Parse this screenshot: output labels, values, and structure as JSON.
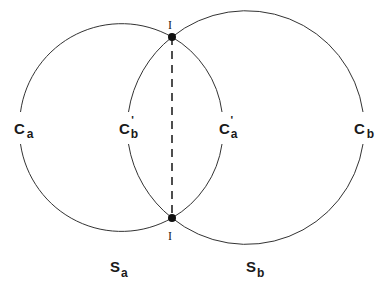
{
  "diagram": {
    "colors": {
      "stroke": "#333333",
      "text": "#1a1a1a",
      "background": "#ffffff"
    },
    "circles": [
      {
        "name": "S_a",
        "label_main": "S",
        "label_sub": "a"
      },
      {
        "name": "S_b",
        "label_main": "S",
        "label_sub": "b"
      }
    ],
    "points": {
      "c_a": {
        "main": "C",
        "sub": "a",
        "prime": ""
      },
      "c_b_prime": {
        "main": "C",
        "sub": "b",
        "prime": "'"
      },
      "c_a_prime": {
        "main": "C",
        "sub": "a",
        "prime": "'"
      },
      "c_b": {
        "main": "C",
        "sub": "b",
        "prime": ""
      }
    },
    "intersections": {
      "top": "I",
      "bottom": "I"
    },
    "chord": "dashed line joining intersection points I"
  }
}
